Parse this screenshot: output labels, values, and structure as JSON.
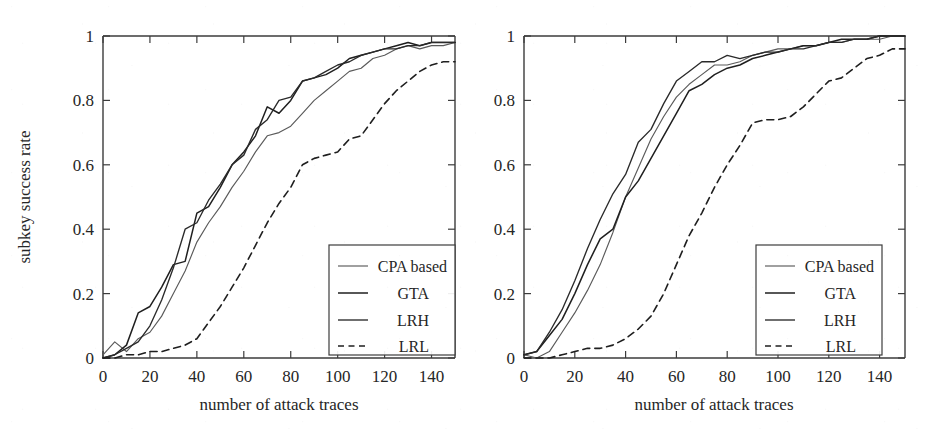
{
  "figure": {
    "background_color": "#ffffff",
    "ink_color": "#262626",
    "panel_count": 2
  },
  "chart_data": [
    {
      "type": "line",
      "panel": "left",
      "title": "",
      "xlabel": "number of attack traces",
      "ylabel": "subkey success rate",
      "xlim": [
        0,
        150
      ],
      "ylim": [
        0,
        1
      ],
      "xticks": [
        0,
        20,
        40,
        60,
        80,
        100,
        120,
        140
      ],
      "xticklabels": [
        "0",
        "20",
        "40",
        "60",
        "80",
        "100",
        "120",
        "140"
      ],
      "yticks": [
        0,
        0.2,
        0.4,
        0.6,
        0.8,
        1
      ],
      "yticklabels": [
        "0",
        "0.2",
        "0.4",
        "0.6",
        "0.8",
        "1"
      ],
      "grid": false,
      "legend_position": "lower right",
      "x": [
        0,
        5,
        10,
        15,
        20,
        25,
        30,
        35,
        40,
        45,
        50,
        55,
        60,
        65,
        70,
        75,
        80,
        85,
        90,
        95,
        100,
        105,
        110,
        115,
        120,
        125,
        130,
        135,
        140,
        145,
        150
      ],
      "series": [
        {
          "name": "CPA based",
          "style": "solid-thin",
          "color": "#5a5a5a",
          "values": [
            0.01,
            0.05,
            0.02,
            0.06,
            0.08,
            0.13,
            0.2,
            0.27,
            0.36,
            0.42,
            0.47,
            0.53,
            0.58,
            0.64,
            0.69,
            0.7,
            0.72,
            0.76,
            0.8,
            0.83,
            0.86,
            0.89,
            0.9,
            0.93,
            0.94,
            0.96,
            0.97,
            0.96,
            0.97,
            0.97,
            0.98
          ]
        },
        {
          "name": "GTA",
          "style": "solid-thick",
          "color": "#1f1f1f",
          "values": [
            0.0,
            0.01,
            0.04,
            0.14,
            0.16,
            0.22,
            0.29,
            0.3,
            0.45,
            0.47,
            0.53,
            0.6,
            0.64,
            0.69,
            0.78,
            0.76,
            0.8,
            0.86,
            0.87,
            0.88,
            0.9,
            0.93,
            0.94,
            0.95,
            0.96,
            0.97,
            0.98,
            0.97,
            0.98,
            0.98,
            0.98
          ]
        },
        {
          "name": "LRH",
          "style": "solid-medium",
          "color": "#2a2a2a",
          "values": [
            0.0,
            0.01,
            0.03,
            0.05,
            0.1,
            0.18,
            0.28,
            0.4,
            0.42,
            0.49,
            0.54,
            0.6,
            0.63,
            0.71,
            0.74,
            0.8,
            0.81,
            0.86,
            0.87,
            0.89,
            0.91,
            0.92,
            0.94,
            0.95,
            0.96,
            0.96,
            0.97,
            0.97,
            0.98,
            0.98,
            0.98
          ]
        },
        {
          "name": "LRL",
          "style": "dashed",
          "color": "#1f1f1f",
          "values": [
            0.0,
            0.0,
            0.01,
            0.01,
            0.02,
            0.02,
            0.03,
            0.04,
            0.06,
            0.11,
            0.16,
            0.22,
            0.28,
            0.35,
            0.42,
            0.48,
            0.53,
            0.6,
            0.62,
            0.63,
            0.64,
            0.68,
            0.69,
            0.74,
            0.79,
            0.83,
            0.86,
            0.89,
            0.91,
            0.92,
            0.92
          ]
        }
      ]
    },
    {
      "type": "line",
      "panel": "right",
      "title": "",
      "xlabel": "number of attack traces",
      "ylabel": "",
      "xlim": [
        0,
        150
      ],
      "ylim": [
        0,
        1
      ],
      "xticks": [
        0,
        20,
        40,
        60,
        80,
        100,
        120,
        140
      ],
      "xticklabels": [
        "0",
        "20",
        "40",
        "60",
        "80",
        "100",
        "120",
        "140"
      ],
      "yticks": [
        0,
        0.2,
        0.4,
        0.6,
        0.8,
        1
      ],
      "yticklabels": [
        "0",
        "0.2",
        "0.4",
        "0.6",
        "0.8",
        "1"
      ],
      "grid": false,
      "legend_position": "lower right",
      "x": [
        0,
        5,
        10,
        15,
        20,
        25,
        30,
        35,
        40,
        45,
        50,
        55,
        60,
        65,
        70,
        75,
        80,
        85,
        90,
        95,
        100,
        105,
        110,
        115,
        120,
        125,
        130,
        135,
        140,
        145,
        150
      ],
      "series": [
        {
          "name": "CPA based",
          "style": "solid-thin",
          "color": "#5a5a5a",
          "values": [
            0.01,
            0.0,
            0.02,
            0.08,
            0.14,
            0.21,
            0.29,
            0.39,
            0.5,
            0.59,
            0.68,
            0.75,
            0.81,
            0.85,
            0.88,
            0.91,
            0.91,
            0.92,
            0.94,
            0.95,
            0.96,
            0.96,
            0.97,
            0.97,
            0.98,
            0.98,
            0.99,
            0.99,
            0.99,
            1.0,
            1.0
          ]
        },
        {
          "name": "GTA",
          "style": "solid-thick",
          "color": "#1f1f1f",
          "values": [
            0.01,
            0.02,
            0.07,
            0.12,
            0.2,
            0.29,
            0.37,
            0.4,
            0.5,
            0.55,
            0.62,
            0.69,
            0.76,
            0.83,
            0.85,
            0.88,
            0.9,
            0.91,
            0.93,
            0.94,
            0.95,
            0.96,
            0.97,
            0.97,
            0.98,
            0.99,
            0.99,
            0.99,
            1.0,
            1.0,
            1.0
          ]
        },
        {
          "name": "LRH",
          "style": "solid-medium",
          "color": "#2a2a2a",
          "values": [
            0.01,
            0.02,
            0.08,
            0.15,
            0.24,
            0.34,
            0.43,
            0.51,
            0.57,
            0.67,
            0.71,
            0.79,
            0.86,
            0.89,
            0.92,
            0.92,
            0.94,
            0.93,
            0.94,
            0.95,
            0.95,
            0.96,
            0.96,
            0.97,
            0.98,
            0.98,
            0.99,
            0.99,
            1.0,
            1.0,
            1.0
          ]
        },
        {
          "name": "LRL",
          "style": "dashed",
          "color": "#1f1f1f",
          "values": [
            0.0,
            0.0,
            0.0,
            0.01,
            0.02,
            0.03,
            0.03,
            0.04,
            0.06,
            0.09,
            0.13,
            0.2,
            0.29,
            0.38,
            0.45,
            0.53,
            0.6,
            0.66,
            0.73,
            0.74,
            0.74,
            0.75,
            0.78,
            0.82,
            0.86,
            0.87,
            0.9,
            0.93,
            0.94,
            0.96,
            0.96
          ]
        }
      ]
    }
  ],
  "left_panel": {
    "y_axis_label": "subkey success rate",
    "x_axis_label": "number of attack traces",
    "y_tick_labels": [
      "0",
      "0.2",
      "0.4",
      "0.6",
      "0.8",
      "1"
    ],
    "x_tick_labels": [
      "0",
      "20",
      "40",
      "60",
      "80",
      "100",
      "120",
      "140"
    ],
    "legend": {
      "items": [
        {
          "label": "CPA based",
          "style": "solid-thin"
        },
        {
          "label": "GTA",
          "style": "solid-thick"
        },
        {
          "label": "LRH",
          "style": "solid-medium"
        },
        {
          "label": "LRL",
          "style": "dashed"
        }
      ]
    }
  },
  "right_panel": {
    "y_axis_label": "",
    "x_axis_label": "number of attack traces",
    "y_tick_labels": [
      "0",
      "0.2",
      "0.4",
      "0.6",
      "0.8",
      "1"
    ],
    "x_tick_labels": [
      "0",
      "20",
      "40",
      "60",
      "80",
      "100",
      "120",
      "140"
    ],
    "legend": {
      "items": [
        {
          "label": "CPA based",
          "style": "solid-thin"
        },
        {
          "label": "GTA",
          "style": "solid-thick"
        },
        {
          "label": "LRH",
          "style": "solid-medium"
        },
        {
          "label": "LRL",
          "style": "dashed"
        }
      ]
    }
  }
}
